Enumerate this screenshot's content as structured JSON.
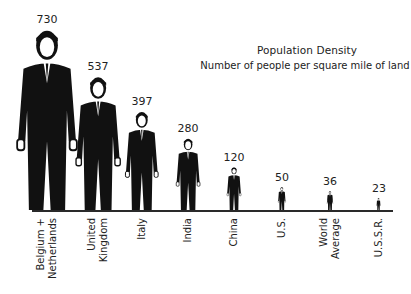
{
  "chart_data": {
    "type": "bar",
    "style": "pictogram (man in suit figures scaled by value)",
    "title": "Population Density",
    "subtitle": "Number of people per square mile of land",
    "xlabel": "",
    "ylabel": "",
    "categories": [
      "Belgium + Netherlands",
      "United Kingdom",
      "Italy",
      "India",
      "China",
      "U.S.",
      "World Average",
      "U.S.S.R."
    ],
    "category_lines": [
      [
        "Belgium +",
        "Netherlands"
      ],
      [
        "United",
        "Kingdom"
      ],
      [
        "Italy"
      ],
      [
        "India"
      ],
      [
        "China"
      ],
      [
        "U.S."
      ],
      [
        "World",
        "Average"
      ],
      [
        "U.S.S.R."
      ]
    ],
    "values": [
      730,
      537,
      397,
      280,
      120,
      50,
      36,
      23
    ],
    "value_labels": [
      "730",
      "537",
      "397",
      "280",
      "120",
      "50",
      "36",
      "23"
    ],
    "grid": false,
    "legend": null
  },
  "labels": {
    "0": "Belgium +\nNetherlands",
    "1": "United\nKingdom",
    "2": "Italy",
    "3": "India",
    "4": "China",
    "5": "U.S.",
    "6": "World\nAverage",
    "7": "U.S.S.R."
  },
  "colors": {
    "figure": "#111111",
    "baseline": "#2a2a2a",
    "background": "#ffffff"
  }
}
